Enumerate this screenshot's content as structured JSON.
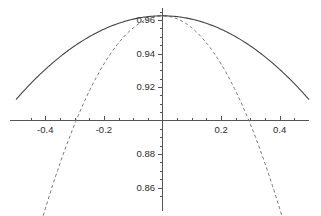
{
  "chart_data": {
    "type": "line",
    "title": "",
    "subtitle": "",
    "xlabel": "",
    "ylabel": "",
    "xlim": [
      -0.5,
      0.5
    ],
    "ylim": [
      0.8495,
      0.9655
    ],
    "grid": false,
    "legend": null,
    "axis_style": "centered-cross",
    "x_axis_value": 0.9,
    "y_axis_value": 0.0,
    "xticks_major": [
      -0.4,
      -0.2,
      0.2,
      0.4
    ],
    "xtick_labels": [
      "-0.4",
      "-0.2",
      "0.2",
      "0.4"
    ],
    "xticks_minor": [
      -0.45,
      -0.35,
      -0.3,
      -0.25,
      -0.15,
      -0.1,
      -0.05,
      0.05,
      0.1,
      0.15,
      0.25,
      0.3,
      0.35,
      0.45
    ],
    "yticks_major": [
      0.86,
      0.88,
      0.92,
      0.94,
      0.96
    ],
    "ytick_labels": [
      "0.86",
      "0.88",
      "0.92",
      "0.94",
      "0.96"
    ],
    "yticks_minor": [
      0.855,
      0.865,
      0.87,
      0.875,
      0.885,
      0.89,
      0.895,
      0.905,
      0.91,
      0.915,
      0.925,
      0.93,
      0.935,
      0.945,
      0.95,
      0.955,
      0.965
    ],
    "series": [
      {
        "name": "solid-curve",
        "style": "solid",
        "color": "#444444",
        "peak_x": 0.0,
        "peak_y": 0.9625,
        "curvature": -0.2,
        "x": [
          -0.5,
          -0.45,
          -0.4,
          -0.35,
          -0.3,
          -0.25,
          -0.2,
          -0.15,
          -0.1,
          -0.05,
          0.0,
          0.05,
          0.1,
          0.15,
          0.2,
          0.25,
          0.3,
          0.35,
          0.4,
          0.45,
          0.5
        ],
        "values": [
          0.9105,
          0.922,
          0.9305,
          0.938,
          0.9445,
          0.95,
          0.9545,
          0.958,
          0.9605,
          0.962,
          0.9625,
          0.962,
          0.9605,
          0.958,
          0.9545,
          0.95,
          0.9445,
          0.938,
          0.9305,
          0.922,
          0.9105
        ]
      },
      {
        "name": "dashed-curve",
        "style": "dashed",
        "color": "#777777",
        "peak_x": 0.0,
        "peak_y": 0.9625,
        "curvature": -0.72,
        "x": [
          -0.5,
          -0.45,
          -0.4,
          -0.35,
          -0.3,
          -0.25,
          -0.2,
          -0.15,
          -0.1,
          -0.05,
          0.0,
          0.05,
          0.1,
          0.15,
          0.2,
          0.25,
          0.3,
          0.35,
          0.4,
          0.45,
          0.5
        ],
        "values": [
          0.8525,
          0.877,
          0.8985,
          0.917,
          0.932,
          0.944,
          0.953,
          0.959,
          0.962,
          0.9625,
          0.9625,
          0.9625,
          0.962,
          0.959,
          0.953,
          0.944,
          0.932,
          0.917,
          0.8985,
          0.877,
          0.8525
        ]
      }
    ]
  },
  "colors": {
    "background": "#ffffff",
    "axis": "#555555",
    "text": "#2b2b2b",
    "solid_series": "#444444",
    "dashed_series": "#777777"
  }
}
